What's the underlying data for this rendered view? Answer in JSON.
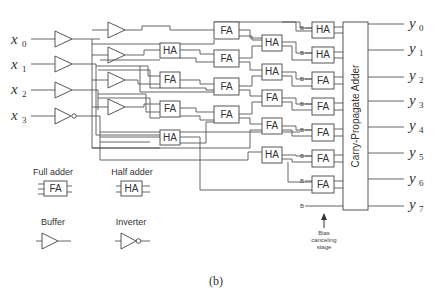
{
  "figure": {
    "caption": "(b)",
    "inputs": [
      {
        "name": "x",
        "sub": "0"
      },
      {
        "name": "x",
        "sub": "1"
      },
      {
        "name": "x",
        "sub": "2"
      },
      {
        "name": "x",
        "sub": "3"
      }
    ],
    "outputs": [
      {
        "name": "y",
        "sub": "0"
      },
      {
        "name": "y",
        "sub": "1"
      },
      {
        "name": "y",
        "sub": "2"
      },
      {
        "name": "y",
        "sub": "3"
      },
      {
        "name": "y",
        "sub": "4"
      },
      {
        "name": "y",
        "sub": "5"
      },
      {
        "name": "y",
        "sub": "6"
      },
      {
        "name": "y",
        "sub": "7"
      }
    ],
    "blocks": {
      "col1": [
        "HA",
        "FA",
        "FA",
        "HA"
      ],
      "col2": [
        "FA",
        "FA",
        "FA",
        "FA"
      ],
      "col3": [
        "HA",
        "HA",
        "FA",
        "FA",
        "HA"
      ],
      "col4": [
        "HA",
        "HA",
        "FA",
        "FA",
        "FA",
        "FA",
        "FA"
      ]
    },
    "bias_label": "B",
    "cpa_label": "Carry-Propagate Adder",
    "bias_annotation": [
      "Bias",
      "canceling",
      "stage"
    ],
    "legend": {
      "full_adder": {
        "title": "Full adder",
        "symbol": "FA"
      },
      "half_adder": {
        "title": "Half adder",
        "symbol": "HA"
      },
      "buffer": {
        "title": "Buffer"
      },
      "inverter": {
        "title": "Inverter"
      }
    }
  }
}
